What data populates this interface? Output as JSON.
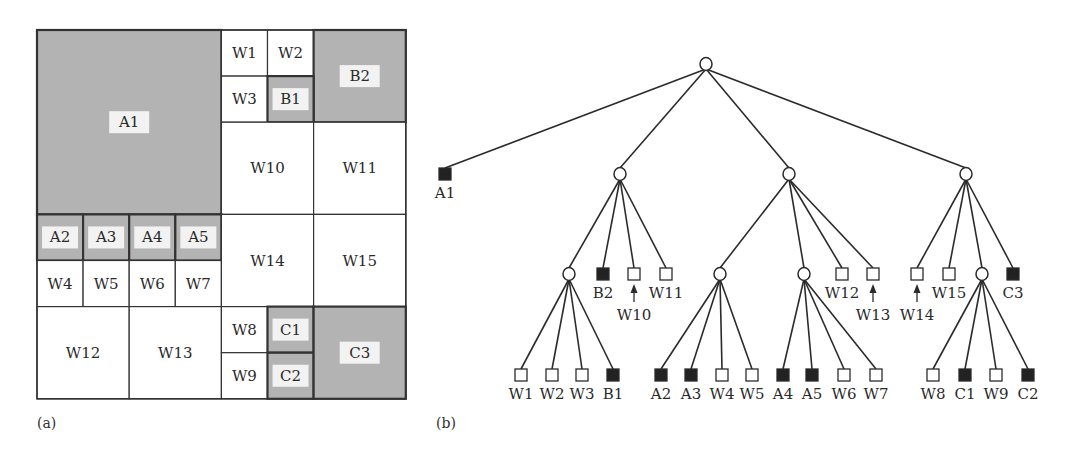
{
  "figure": {
    "panel_a": {
      "label": "(a)",
      "unit_px": 46.1,
      "origin": [
        37,
        30
      ],
      "grid_size": 8,
      "colors": {
        "black_fill": "#b3b3b3",
        "white_fill": "#ffffff",
        "border": "#333333",
        "label_bg": "#f2f2f2"
      },
      "cells": [
        {
          "id": "A1",
          "x": 0,
          "y": 0,
          "w": 4,
          "h": 4,
          "type": "black"
        },
        {
          "id": "W1",
          "x": 4,
          "y": 0,
          "w": 1,
          "h": 1,
          "type": "white"
        },
        {
          "id": "W2",
          "x": 5,
          "y": 0,
          "w": 1,
          "h": 1,
          "type": "white"
        },
        {
          "id": "B2",
          "x": 6,
          "y": 0,
          "w": 2,
          "h": 2,
          "type": "black"
        },
        {
          "id": "W3",
          "x": 4,
          "y": 1,
          "w": 1,
          "h": 1,
          "type": "white"
        },
        {
          "id": "B1",
          "x": 5,
          "y": 1,
          "w": 1,
          "h": 1,
          "type": "black"
        },
        {
          "id": "W10",
          "x": 4,
          "y": 2,
          "w": 2,
          "h": 2,
          "type": "white"
        },
        {
          "id": "W11",
          "x": 6,
          "y": 2,
          "w": 2,
          "h": 2,
          "type": "white"
        },
        {
          "id": "A2",
          "x": 0,
          "y": 4,
          "w": 1,
          "h": 1,
          "type": "black"
        },
        {
          "id": "A3",
          "x": 1,
          "y": 4,
          "w": 1,
          "h": 1,
          "type": "black"
        },
        {
          "id": "A4",
          "x": 2,
          "y": 4,
          "w": 1,
          "h": 1,
          "type": "black"
        },
        {
          "id": "A5",
          "x": 3,
          "y": 4,
          "w": 1,
          "h": 1,
          "type": "black"
        },
        {
          "id": "W4",
          "x": 0,
          "y": 5,
          "w": 1,
          "h": 1,
          "type": "white"
        },
        {
          "id": "W5",
          "x": 1,
          "y": 5,
          "w": 1,
          "h": 1,
          "type": "white"
        },
        {
          "id": "W6",
          "x": 2,
          "y": 5,
          "w": 1,
          "h": 1,
          "type": "white"
        },
        {
          "id": "W7",
          "x": 3,
          "y": 5,
          "w": 1,
          "h": 1,
          "type": "white"
        },
        {
          "id": "W14",
          "x": 4,
          "y": 4,
          "w": 2,
          "h": 2,
          "type": "white"
        },
        {
          "id": "W15",
          "x": 6,
          "y": 4,
          "w": 2,
          "h": 2,
          "type": "white"
        },
        {
          "id": "W12",
          "x": 0,
          "y": 6,
          "w": 2,
          "h": 2,
          "type": "white"
        },
        {
          "id": "W13",
          "x": 2,
          "y": 6,
          "w": 2,
          "h": 2,
          "type": "white"
        },
        {
          "id": "W8",
          "x": 4,
          "y": 6,
          "w": 1,
          "h": 1,
          "type": "white"
        },
        {
          "id": "C1",
          "x": 5,
          "y": 6,
          "w": 1,
          "h": 1,
          "type": "black"
        },
        {
          "id": "W9",
          "x": 4,
          "y": 7,
          "w": 1,
          "h": 1,
          "type": "white"
        },
        {
          "id": "C2",
          "x": 5,
          "y": 7,
          "w": 1,
          "h": 1,
          "type": "black"
        },
        {
          "id": "C3",
          "x": 6,
          "y": 6,
          "w": 2,
          "h": 2,
          "type": "black"
        }
      ]
    },
    "panel_b": {
      "label": "(b)",
      "colors": {
        "edge": "#2b2b2b",
        "black_leaf": "#222222",
        "white_leaf": "#ffffff"
      },
      "nodes": [
        {
          "id": "root",
          "kind": "gray",
          "x": 706,
          "y": 64
        },
        {
          "id": "A1",
          "kind": "black",
          "x": 445,
          "y": 174,
          "label": "A1",
          "label_pos": "below"
        },
        {
          "id": "n1",
          "kind": "gray",
          "x": 620,
          "y": 174
        },
        {
          "id": "n2",
          "kind": "gray",
          "x": 789,
          "y": 174
        },
        {
          "id": "n3",
          "kind": "gray",
          "x": 966,
          "y": 174
        },
        {
          "id": "n11",
          "kind": "gray",
          "x": 569,
          "y": 274
        },
        {
          "id": "B2",
          "kind": "black",
          "x": 603,
          "y": 274,
          "label": "B2",
          "label_pos": "below"
        },
        {
          "id": "W10",
          "kind": "white",
          "x": 634,
          "y": 274,
          "label": "W10",
          "label_pos": "arrow"
        },
        {
          "id": "W11",
          "kind": "white",
          "x": 666,
          "y": 274,
          "label": "W11",
          "label_pos": "below"
        },
        {
          "id": "n21",
          "kind": "gray",
          "x": 720,
          "y": 274
        },
        {
          "id": "n22",
          "kind": "gray",
          "x": 804,
          "y": 274
        },
        {
          "id": "W12",
          "kind": "white",
          "x": 842,
          "y": 274,
          "label": "W12",
          "label_pos": "below"
        },
        {
          "id": "W13",
          "kind": "white",
          "x": 873,
          "y": 274,
          "label": "W13",
          "label_pos": "arrow"
        },
        {
          "id": "W14",
          "kind": "white",
          "x": 917,
          "y": 274,
          "label": "W14",
          "label_pos": "arrow"
        },
        {
          "id": "W15",
          "kind": "white",
          "x": 949,
          "y": 274,
          "label": "W15",
          "label_pos": "below"
        },
        {
          "id": "n31",
          "kind": "gray",
          "x": 982,
          "y": 274
        },
        {
          "id": "C3",
          "kind": "black",
          "x": 1013,
          "y": 274,
          "label": "C3",
          "label_pos": "below"
        },
        {
          "id": "W1",
          "kind": "white",
          "x": 521,
          "y": 375,
          "label": "W1",
          "label_pos": "below"
        },
        {
          "id": "W2",
          "kind": "white",
          "x": 552,
          "y": 375,
          "label": "W2",
          "label_pos": "below"
        },
        {
          "id": "W3",
          "kind": "white",
          "x": 582,
          "y": 375,
          "label": "W3",
          "label_pos": "below"
        },
        {
          "id": "B1",
          "kind": "black",
          "x": 613,
          "y": 375,
          "label": "B1",
          "label_pos": "below"
        },
        {
          "id": "A2",
          "kind": "black",
          "x": 661,
          "y": 375,
          "label": "A2",
          "label_pos": "below"
        },
        {
          "id": "A3",
          "kind": "black",
          "x": 691,
          "y": 375,
          "label": "A3",
          "label_pos": "below"
        },
        {
          "id": "W4",
          "kind": "white",
          "x": 722,
          "y": 375,
          "label": "W4",
          "label_pos": "below"
        },
        {
          "id": "W5",
          "kind": "white",
          "x": 752,
          "y": 375,
          "label": "W5",
          "label_pos": "below"
        },
        {
          "id": "A4",
          "kind": "black",
          "x": 783,
          "y": 375,
          "label": "A4",
          "label_pos": "below"
        },
        {
          "id": "A5",
          "kind": "black",
          "x": 812,
          "y": 375,
          "label": "A5",
          "label_pos": "below"
        },
        {
          "id": "W6",
          "kind": "white",
          "x": 844,
          "y": 375,
          "label": "W6",
          "label_pos": "below"
        },
        {
          "id": "W7",
          "kind": "white",
          "x": 876,
          "y": 375,
          "label": "W7",
          "label_pos": "below"
        },
        {
          "id": "W8",
          "kind": "white",
          "x": 933,
          "y": 375,
          "label": "W8",
          "label_pos": "below"
        },
        {
          "id": "C1",
          "kind": "black",
          "x": 965,
          "y": 375,
          "label": "C1",
          "label_pos": "below"
        },
        {
          "id": "W9",
          "kind": "white",
          "x": 996,
          "y": 375,
          "label": "W9",
          "label_pos": "below"
        },
        {
          "id": "C2",
          "kind": "black",
          "x": 1028,
          "y": 375,
          "label": "C2",
          "label_pos": "below"
        }
      ],
      "edges": [
        [
          "root",
          "A1"
        ],
        [
          "root",
          "n1"
        ],
        [
          "root",
          "n2"
        ],
        [
          "root",
          "n3"
        ],
        [
          "n1",
          "n11"
        ],
        [
          "n1",
          "B2"
        ],
        [
          "n1",
          "W10"
        ],
        [
          "n1",
          "W11"
        ],
        [
          "n2",
          "n21"
        ],
        [
          "n2",
          "n22"
        ],
        [
          "n2",
          "W12"
        ],
        [
          "n2",
          "W13"
        ],
        [
          "n3",
          "W14"
        ],
        [
          "n3",
          "W15"
        ],
        [
          "n3",
          "n31"
        ],
        [
          "n3",
          "C3"
        ],
        [
          "n11",
          "W1"
        ],
        [
          "n11",
          "W2"
        ],
        [
          "n11",
          "W3"
        ],
        [
          "n11",
          "B1"
        ],
        [
          "n21",
          "A2"
        ],
        [
          "n21",
          "A3"
        ],
        [
          "n21",
          "W4"
        ],
        [
          "n21",
          "W5"
        ],
        [
          "n22",
          "A4"
        ],
        [
          "n22",
          "A5"
        ],
        [
          "n22",
          "W6"
        ],
        [
          "n22",
          "W7"
        ],
        [
          "n31",
          "W8"
        ],
        [
          "n31",
          "C1"
        ],
        [
          "n31",
          "W9"
        ],
        [
          "n31",
          "C2"
        ]
      ]
    }
  }
}
